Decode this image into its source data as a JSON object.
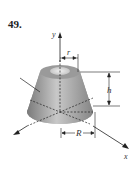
{
  "problem": {
    "number": "49."
  },
  "diagram": {
    "type": "frustum of a cone",
    "labels": {
      "y_axis": "y",
      "x_axis": "x",
      "top_radius": "r",
      "height": "h",
      "bottom_radius": "R"
    },
    "colors": {
      "surface_light": "#d8d8d8",
      "surface_dark": "#8a8a8a",
      "line": "#222222"
    }
  }
}
